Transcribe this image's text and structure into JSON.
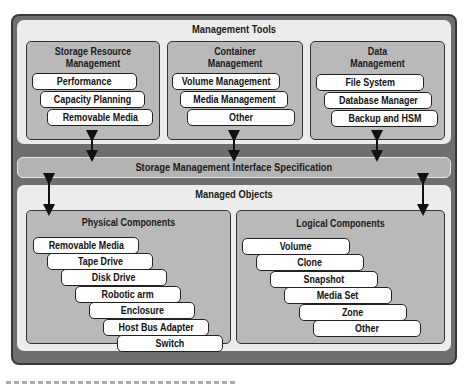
{
  "management_tools": {
    "title": "Management Tools",
    "groups": [
      {
        "title_line1": "Storage Resource",
        "title_line2": "Management",
        "items": [
          "Performance",
          "Capacity Planning",
          "Removable Media"
        ]
      },
      {
        "title_line1": "Container",
        "title_line2": "Management",
        "items": [
          "Volume Management",
          "Media Management",
          "Other"
        ]
      },
      {
        "title_line1": "Data",
        "title_line2": "Management",
        "items": [
          "File System",
          "Database Manager",
          "Backup and HSM"
        ]
      }
    ]
  },
  "interface": {
    "label": "Storage Management Interface Specification"
  },
  "managed_objects": {
    "title": "Managed Objects",
    "physical": {
      "title": "Physical Components",
      "items": [
        "Removable Media",
        "Tape Drive",
        "Disk Drive",
        "Robotic arm",
        "Enclosure",
        "Host Bus Adapter",
        "Switch"
      ]
    },
    "logical": {
      "title": "Logical Components",
      "items": [
        "Volume",
        "Clone",
        "Snapshot",
        "Media Set",
        "Zone",
        "Other"
      ]
    }
  },
  "colors": {
    "outer": "#6f6f6f",
    "panel": "#ececec",
    "group": "#b9b9b9",
    "pill": "#ffffff",
    "border": "#222222"
  }
}
